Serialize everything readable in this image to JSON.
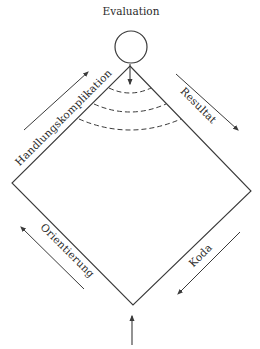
{
  "diagram": {
    "title": "Evaluation",
    "labels": {
      "complication": "Handlungskomplikation",
      "result": "Resultat",
      "orientation": "Orientierung",
      "coda": "Koda"
    },
    "icons": {
      "evaluation_node": "circle",
      "arrow_up_right": "arrow-icon",
      "arrow_down_right": "arrow-icon",
      "arrow_up_left": "arrow-icon",
      "arrow_down_left": "arrow-icon",
      "entry_arrow": "arrow-up-icon",
      "evaluation_arrow": "arrow-down-icon"
    },
    "colors": {
      "line": "#3a3a3a",
      "text": "#2a2a2a",
      "background": "#ffffff"
    }
  }
}
